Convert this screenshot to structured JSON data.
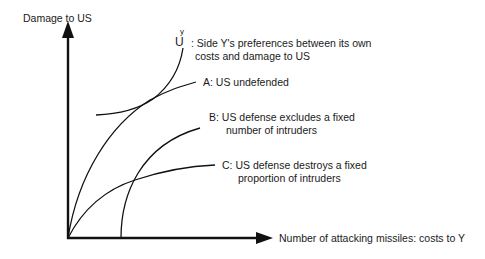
{
  "diagram": {
    "y_axis_label": "Damage to US",
    "x_axis_label": "Number of attacking missiles: costs to Y",
    "utility": {
      "symbol": "U",
      "superscript": "y",
      "line1": ": Side Y's preferences between its own",
      "line2": "costs and damage to US"
    },
    "curves": [
      {
        "id": "A",
        "line1": "A: US undefended",
        "line2": ""
      },
      {
        "id": "B",
        "line1": "B: US defense excludes a fixed",
        "line2": "number of intruders"
      },
      {
        "id": "C",
        "line1": "C: US defense destroys a fixed",
        "line2": "proportion of intruders"
      }
    ],
    "colors": {
      "line": "#111111",
      "background": "#ffffff"
    }
  }
}
